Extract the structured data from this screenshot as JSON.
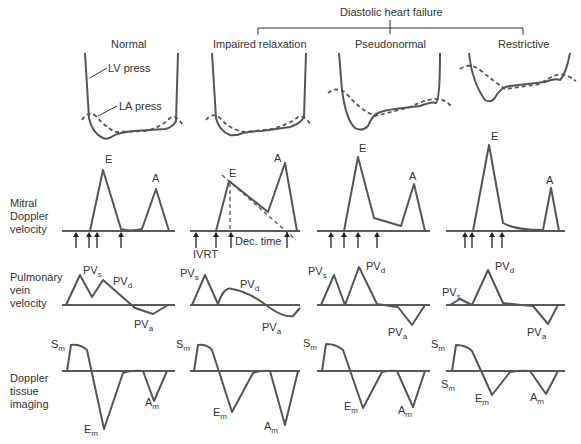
{
  "header": {
    "group_label": "Diastolic heart failure",
    "columns": [
      "Normal",
      "Impaired relaxation",
      "Pseudonormal",
      "Restrictive"
    ]
  },
  "annotations": {
    "lv_press": "LV press",
    "la_press": "LA press",
    "ivrt": "IVRT",
    "dec_time": "Dec. time"
  },
  "rows": {
    "mitral": [
      "Mitral",
      "Doppler",
      "velocity"
    ],
    "pulmonary": [
      "Pulmonary",
      "vein",
      "velocity"
    ],
    "tissue": [
      "Doppler",
      "tissue",
      "imaging"
    ]
  },
  "wave_labels": {
    "E": "E",
    "A": "A",
    "PV": "PV",
    "s": "s",
    "d": "d",
    "a": "a",
    "S": "S",
    "Em": "E",
    "Am": "A",
    "m": "m"
  },
  "colors": {
    "trace": "#555555",
    "axis": "#222222",
    "text": "#333333",
    "background": "#ffffff"
  }
}
